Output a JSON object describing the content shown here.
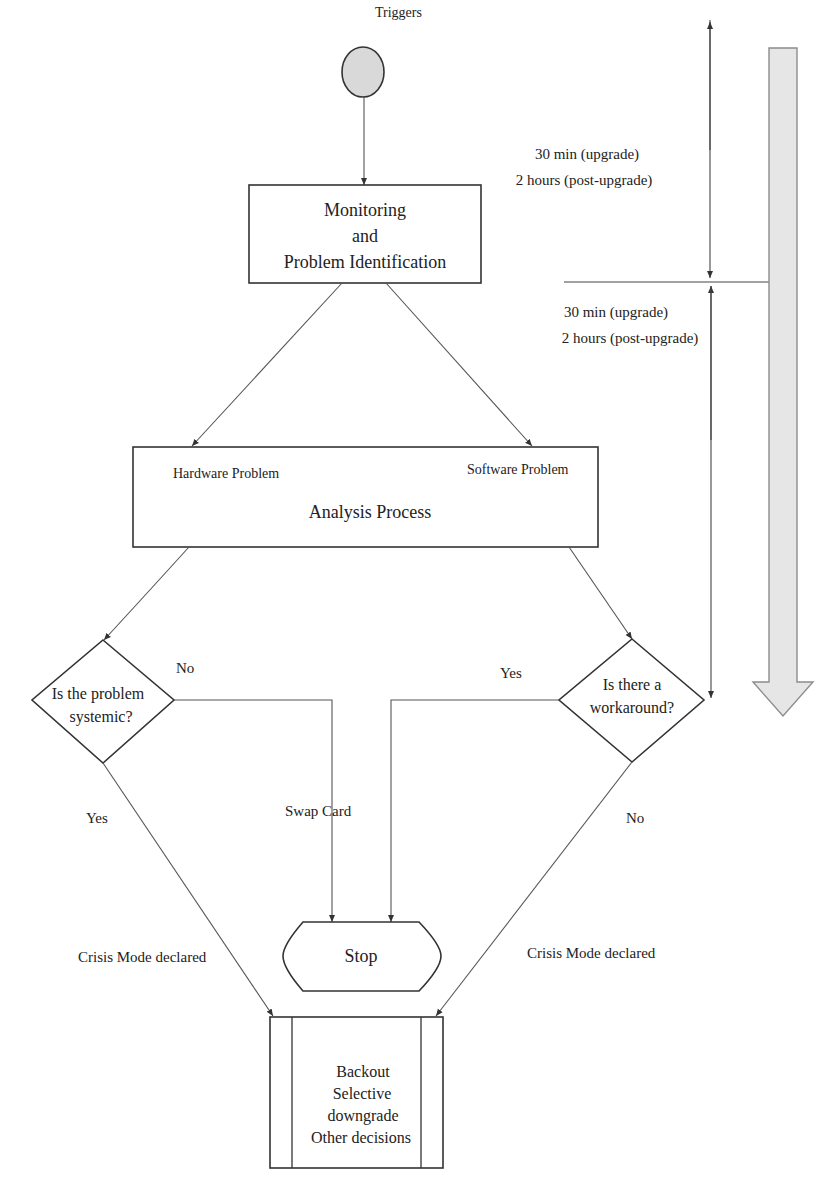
{
  "diagram": {
    "type": "flowchart",
    "colors": {
      "line": "#555555",
      "node_border": "#333333",
      "start_fill": "#d9d9d9",
      "timeline_arrow_fill": "#e6e6e6",
      "timeline_arrow_border": "#8c8c8c",
      "text": "#222222"
    },
    "start": {
      "label": "Triggers"
    },
    "monitoring": {
      "lines": [
        "Monitoring",
        "and",
        "Problem Identification"
      ]
    },
    "timing": {
      "first": {
        "line1": "30 min (upgrade)",
        "line2": "2 hours (post-upgrade)"
      },
      "second": {
        "line1": "30 min (upgrade)",
        "line2": "2 hours (post-upgrade)"
      }
    },
    "analysis": {
      "title": "Analysis Process",
      "left_label": "Hardware Problem",
      "right_label": "Software Problem"
    },
    "decision_left": {
      "lines": [
        "Is the problem",
        "systemic?"
      ],
      "no_label": "No",
      "yes_label": "Yes"
    },
    "decision_right": {
      "lines": [
        "Is there a",
        "workaround?"
      ],
      "yes_label": "Yes",
      "no_label": "No"
    },
    "swap_label": "Swap Card",
    "stop": {
      "label": "Stop"
    },
    "crisis_left": "Crisis Mode declared",
    "crisis_right": "Crisis Mode declared",
    "outcome": {
      "lines": [
        "Backout",
        "Selective",
        "downgrade",
        "Other decisions"
      ]
    }
  }
}
